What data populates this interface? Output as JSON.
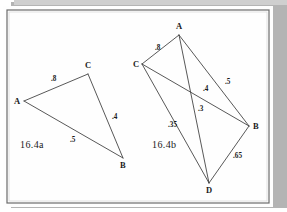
{
  "page": {
    "background_color": "#ffffff",
    "frame": {
      "border_color": "#5c5c5c",
      "shadow_color": "#a9a9a9",
      "inner_background": "#fdfdfd"
    },
    "ink_color": "#3a3a3a"
  },
  "figures": [
    {
      "id": "16.4a",
      "caption": "16.4a",
      "caption_pos": {
        "x": 20,
        "y": 148
      },
      "nodes": [
        {
          "id": "A",
          "label": "A",
          "x": 24,
          "y": 101,
          "label_x": 14,
          "label_y": 104
        },
        {
          "id": "C",
          "label": "C",
          "x": 88,
          "y": 74,
          "label_x": 85,
          "label_y": 68
        },
        {
          "id": "B",
          "label": "B",
          "x": 123,
          "y": 158,
          "label_x": 120,
          "label_y": 168
        }
      ],
      "edges": [
        {
          "from": "A",
          "to": "C",
          "weight": ".8",
          "label_x": 51,
          "label_y": 81
        },
        {
          "from": "C",
          "to": "B",
          "weight": ".4",
          "label_x": 112,
          "label_y": 119
        },
        {
          "from": "A",
          "to": "B",
          "weight": ".5",
          "label_x": 70,
          "label_y": 142
        }
      ]
    },
    {
      "id": "16.4b",
      "caption": "16.4b",
      "caption_pos": {
        "x": 152,
        "y": 148
      },
      "nodes": [
        {
          "id": "A",
          "label": "A",
          "x": 179,
          "y": 35,
          "label_x": 176,
          "label_y": 29
        },
        {
          "id": "C",
          "label": "C",
          "x": 142,
          "y": 64,
          "label_x": 133,
          "label_y": 67
        },
        {
          "id": "B",
          "label": "B",
          "x": 249,
          "y": 126,
          "label_x": 253,
          "label_y": 129
        },
        {
          "id": "D",
          "label": "D",
          "x": 209,
          "y": 183,
          "label_x": 206,
          "label_y": 193
        }
      ],
      "edges": [
        {
          "from": "C",
          "to": "A",
          "weight": ".8",
          "label_x": 155,
          "label_y": 50
        },
        {
          "from": "A",
          "to": "B",
          "weight": ".5",
          "label_x": 225,
          "label_y": 84
        },
        {
          "from": "C",
          "to": "B",
          "weight": ".4",
          "label_x": 203,
          "label_y": 91
        },
        {
          "from": "A",
          "to": "D",
          "weight": ".3",
          "label_x": 198,
          "label_y": 111
        },
        {
          "from": "C",
          "to": "D",
          "weight": ".35",
          "label_x": 168,
          "label_y": 127
        },
        {
          "from": "D",
          "to": "B",
          "weight": ".65",
          "label_x": 233,
          "label_y": 158
        }
      ]
    }
  ]
}
